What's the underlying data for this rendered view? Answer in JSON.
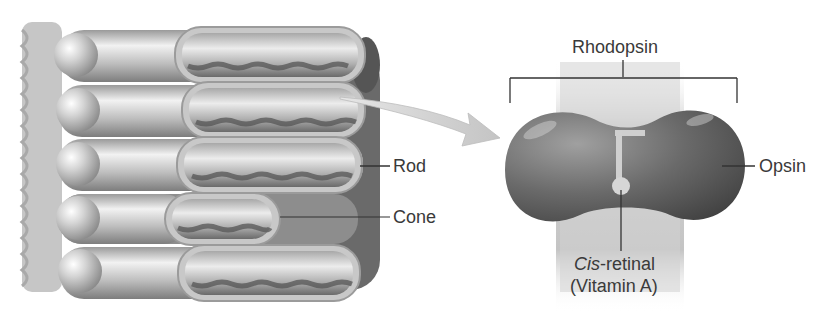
{
  "diagram": {
    "left_panel": {
      "subject": "photoreceptor cells (rods and cones)",
      "labels": {
        "rod": "Rod",
        "cone": "Cone"
      },
      "rows": [
        {
          "type": "rod"
        },
        {
          "type": "rod"
        },
        {
          "type": "rod"
        },
        {
          "type": "cone"
        },
        {
          "type": "rod"
        }
      ]
    },
    "right_panel": {
      "subject": "rhodopsin molecule",
      "labels": {
        "rhodopsin": "Rhodopsin",
        "opsin": "Opsin",
        "cis_prefix": "Cis",
        "cis_suffix": "-retinal",
        "vitamin": "(Vitamin A)"
      }
    },
    "arrow": {
      "from": "rod outer segment",
      "to": "rhodopsin"
    },
    "colors": {
      "background": "#ffffff",
      "cell_light": "#d8d8d8",
      "cell_dark": "#6e6e6e",
      "protein_dark": "#5c5c5c",
      "membrane": "#cfcfcf",
      "label_text": "#3a3a3a",
      "leader_line": "#333333"
    }
  }
}
